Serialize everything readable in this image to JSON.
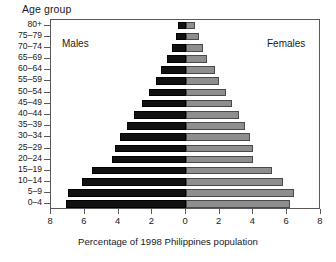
{
  "chart_data": {
    "type": "bar",
    "subtype": "population-pyramid",
    "title": "",
    "ylabel": "Age group",
    "xlabel": "Percentage of 1998 Philippines population",
    "grid": false,
    "legend_position": "in-plot",
    "xlim": [
      -8,
      8
    ],
    "x_axis_ticks": [
      8,
      6,
      4,
      2,
      0,
      2,
      4,
      6,
      8
    ],
    "x_axis_tick_labels": [
      "8",
      "6",
      "4",
      "2",
      "0",
      "2",
      "4",
      "6",
      "8"
    ],
    "categories": [
      "80+",
      "75–79",
      "70–74",
      "65–69",
      "60–64",
      "55–59",
      "50–54",
      "45–49",
      "40–44",
      "35–39",
      "30–34",
      "25–29",
      "20–24",
      "15–19",
      "10–14",
      "5–9",
      "0–4"
    ],
    "series": [
      {
        "name": "Males",
        "side": "left",
        "color": "#111111",
        "values": [
          0.45,
          0.6,
          0.85,
          1.15,
          1.5,
          1.8,
          2.2,
          2.6,
          3.1,
          3.5,
          3.9,
          4.2,
          4.4,
          5.6,
          6.2,
          7.0,
          7.15
        ]
      },
      {
        "name": "Females",
        "side": "right",
        "color": "#8e8e8e",
        "values": [
          0.55,
          0.75,
          1.0,
          1.25,
          1.7,
          1.95,
          2.35,
          2.75,
          3.15,
          3.5,
          3.8,
          4.0,
          4.0,
          5.1,
          5.75,
          6.4,
          6.2
        ]
      }
    ]
  },
  "annotations": {
    "males_label": "Males",
    "females_label": "Females"
  }
}
